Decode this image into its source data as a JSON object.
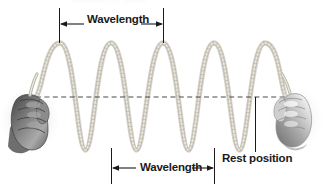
{
  "figure": {
    "title_remnant": "Transverse wave",
    "background_color": "#ffffff",
    "width": 323,
    "height": 188
  },
  "labels": {
    "wavelength_top": "Wavelength",
    "wavelength_bottom": "Wavelength",
    "rest_position": "Rest position"
  },
  "colors": {
    "rope": "#b9b5a9",
    "rope_shade": "#8d897e",
    "rope_highlight": "#e8e5dd",
    "ink": "#1a1a1a",
    "hand_dark": "#5b5b5b",
    "hand_mid": "#9a9a9a",
    "hand_light": "#d8d8d8",
    "dashed_line": "#4a4a4a"
  },
  "geometry": {
    "rest_line_y": 97,
    "rest_line_x_start": 36,
    "rest_line_x_end": 286,
    "crest_y": 43,
    "trough_y": 150,
    "crests_x": [
      60,
      163,
      265
    ],
    "troughs_x": [
      111,
      214
    ],
    "amplitude": 54,
    "wavelength_px": 103
  },
  "measures": {
    "top": {
      "x_left": 59,
      "x_right": 163,
      "tick_top": 8,
      "tick_bottom": 42,
      "arrow_y": 24
    },
    "bottom": {
      "x_left": 111,
      "x_right": 214,
      "tick_top": 148,
      "tick_bottom": 184,
      "arrow_y": 168
    },
    "rest_leader": {
      "x": 255,
      "y_top": 97,
      "y_bottom": 152
    }
  },
  "icons": {
    "left_hand": "hand-gripping-rope-icon",
    "right_hand": "hand-gripping-rope-icon",
    "arrow_left": "arrow-left-icon",
    "arrow_right": "arrow-right-icon"
  }
}
